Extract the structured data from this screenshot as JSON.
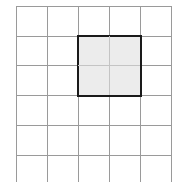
{
  "grid": {
    "columns": 5,
    "rows": 6,
    "cell_width": 31,
    "cell_height": 29.7,
    "line_color": "#9a9a9a"
  },
  "highlight": {
    "col_start": 2,
    "row_start": 1,
    "col_span": 2,
    "row_span": 2,
    "fill_color": "#ececec",
    "border_color": "#1a1a1a"
  }
}
